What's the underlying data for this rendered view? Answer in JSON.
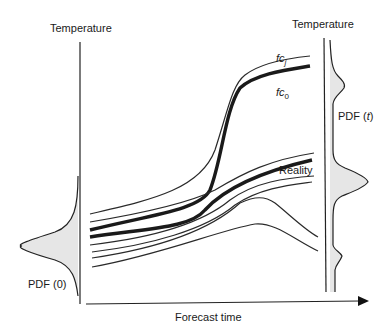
{
  "diagram": {
    "left_axis": {
      "label": "Temperature",
      "pdf_label": "PDF (0)"
    },
    "right_axis": {
      "label": "Temperature",
      "pdf_label_prefix": "PDF (",
      "pdf_label_var": "t",
      "pdf_label_suffix": ")"
    },
    "x_axis": {
      "label": "Forecast time"
    },
    "curves": {
      "fcj": {
        "base": "fc",
        "subscript": "j"
      },
      "fc0": {
        "base": "fc",
        "subscript": "0"
      },
      "reality": {
        "label": "Reality"
      }
    },
    "colors": {
      "line": "#222222",
      "thin_line": "#3a3a3a",
      "pdf_fill": "#e6e6e6"
    }
  }
}
